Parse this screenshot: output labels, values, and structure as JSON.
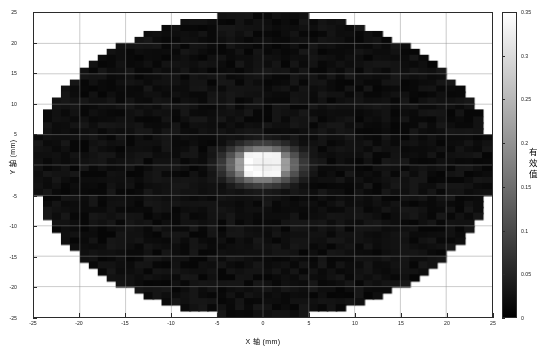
{
  "figure": {
    "background_color": "#ffffff",
    "axes_color": "#2b2b2b",
    "grid_color": "#8c8c8c"
  },
  "axes": {
    "xlabel": "X 轴 (mm)",
    "ylabel": "Y 轴 (mm)",
    "xticks": [
      "-25",
      "-20",
      "-15",
      "-10",
      "-5",
      "0",
      "5",
      "10",
      "15",
      "20",
      "25"
    ],
    "yticks": [
      "25",
      "20",
      "15",
      "10",
      "5",
      "0",
      "-5",
      "-10",
      "-15",
      "-20",
      "-25"
    ]
  },
  "colorbar": {
    "label_chars": [
      "有",
      "效",
      "值"
    ],
    "label": "有效值",
    "ticks": [
      "0.35",
      "0.3",
      "0.25",
      "0.2",
      "0.15",
      "0.1",
      "0.05",
      "0"
    ],
    "low_color": "#000000",
    "high_color": "#ffffff"
  },
  "chart_data": {
    "type": "heatmap",
    "title": "",
    "xlabel": "X 轴 (mm)",
    "ylabel": "Y 轴 (mm)",
    "zlabel": "有效值",
    "colormap": "gray",
    "grid": true,
    "legend": "colorbar-right",
    "xlim": [
      -25,
      25
    ],
    "ylim": [
      -25,
      25
    ],
    "zlim": [
      0,
      0.35
    ],
    "xticks": [
      -25,
      -20,
      -15,
      -10,
      -5,
      0,
      5,
      10,
      15,
      20,
      25
    ],
    "yticks": [
      -25,
      -20,
      -15,
      -10,
      -5,
      0,
      5,
      10,
      15,
      20,
      25
    ],
    "zticks": [
      0,
      0.05,
      0.1,
      0.15,
      0.2,
      0.25,
      0.3,
      0.35
    ],
    "cell_size_mm": 1.0,
    "mask": {
      "shape": "ellipse",
      "center": [
        0,
        0
      ],
      "semi_axis_x_mm": 25,
      "semi_axis_y_mm": 25,
      "note": "stepped elliptical data footprint; outside mask is blank white"
    },
    "background_level": 0.02,
    "background_noise_amplitude": 0.012,
    "hotspot": {
      "center_x_mm": 0.0,
      "center_y_mm": 0.0,
      "peak_value": 0.35,
      "core_half_width_mm": 2.0,
      "core_half_height_mm": 1.6,
      "halo_sigma_x_mm": 2.6,
      "halo_sigma_y_mm": 2.1
    }
  }
}
